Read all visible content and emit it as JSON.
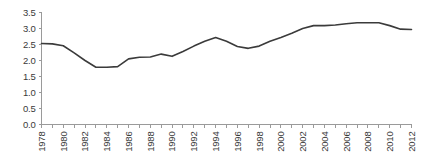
{
  "chart_data": {
    "type": "line",
    "title": "",
    "subtitle": "",
    "xlabel": "",
    "ylabel": "",
    "grid": false,
    "legend": "none",
    "xlim": [
      1978,
      2012
    ],
    "ylim": [
      0.0,
      3.5
    ],
    "y_ticks": [
      "0.0",
      "0.5",
      "1.0",
      "1.5",
      "2.0",
      "2.5",
      "3.0",
      "3.5"
    ],
    "y_tick_values": [
      0.0,
      0.5,
      1.0,
      1.5,
      2.0,
      2.5,
      3.0,
      3.5
    ],
    "x_tick_labels": [
      "1978",
      "1980",
      "1982",
      "1984",
      "1986",
      "1988",
      "1990",
      "1992",
      "1994",
      "1996",
      "1998",
      "2000",
      "2002",
      "2004",
      "2006",
      "2008",
      "2010",
      "2012"
    ],
    "x_tick_label_rotation": -90,
    "x_minor_ticks_every": 1,
    "series_color": "#3b3b3b",
    "axis_color": "#9a9a9a",
    "x": [
      1978,
      1979,
      1980,
      1981,
      1982,
      1983,
      1984,
      1985,
      1986,
      1987,
      1988,
      1989,
      1990,
      1991,
      1992,
      1993,
      1994,
      1995,
      1996,
      1997,
      1998,
      1999,
      2000,
      2001,
      2002,
      2003,
      2004,
      2005,
      2006,
      2007,
      2008,
      2009,
      2010,
      2011,
      2012
    ],
    "series": [
      {
        "name": "series-1",
        "color": "#3b3b3b",
        "values": [
          2.53,
          2.52,
          2.46,
          2.24,
          2.0,
          1.79,
          1.79,
          1.81,
          2.05,
          2.1,
          2.11,
          2.2,
          2.13,
          2.28,
          2.45,
          2.6,
          2.72,
          2.6,
          2.44,
          2.38,
          2.45,
          2.6,
          2.72,
          2.85,
          3.0,
          3.09,
          3.09,
          3.11,
          3.15,
          3.18,
          3.18,
          3.18,
          3.09,
          2.98,
          2.97
        ]
      }
    ]
  }
}
